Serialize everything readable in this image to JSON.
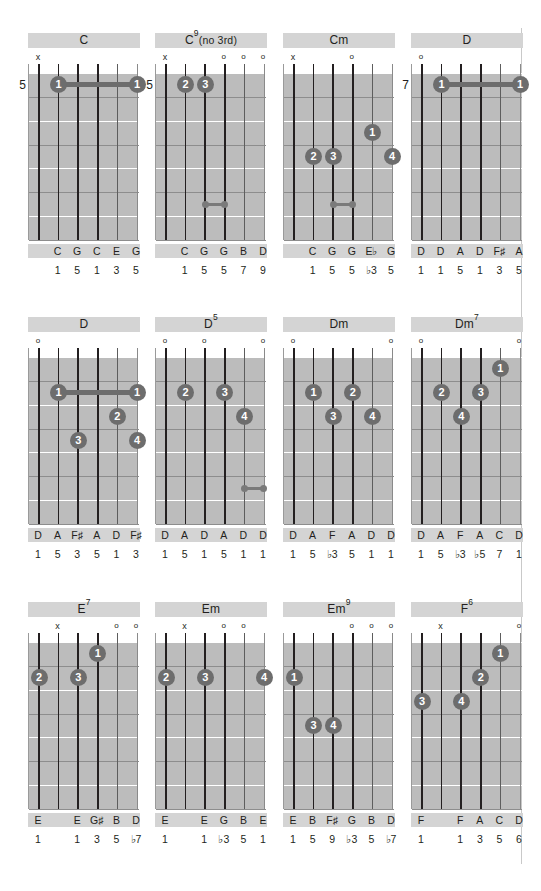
{
  "page": {
    "width": 541,
    "height": 891,
    "background": "#ffffff",
    "divider_color": "#c9c9c9",
    "board_color": "#bcbcbc",
    "label_bar_color": "#d4d4d4",
    "dot_color": "#6d6d6d",
    "string_color": "#231f20",
    "text_color": "#231f20"
  },
  "legend": {
    "muted_symbol": "x",
    "open_symbol": "o",
    "strings": 6,
    "frets": 7
  },
  "chords": [
    {
      "name": "C",
      "title_main": "C",
      "title_sup": "",
      "title_tail": "",
      "position_fret": "5",
      "markers": [
        "x",
        "",
        "",
        "",
        "",
        ""
      ],
      "dots": [
        {
          "string": 2,
          "fret": 1,
          "finger": "1"
        },
        {
          "string": 6,
          "fret": 1,
          "finger": "1"
        }
      ],
      "barres": [
        {
          "fret": 1,
          "from_string": 2,
          "to_string": 6
        }
      ],
      "links": [],
      "notes": [
        "",
        "C",
        "G",
        "C",
        "E",
        "G"
      ],
      "degrees": [
        "",
        "1",
        "5",
        "1",
        "3",
        "5"
      ]
    },
    {
      "name": "C9(no 3rd)",
      "title_main": "C",
      "title_sup": "9",
      "title_tail": "(no 3rd)",
      "position_fret": "5",
      "markers": [
        "x",
        "",
        "",
        "o",
        "o",
        "o"
      ],
      "dots": [
        {
          "string": 2,
          "fret": 1,
          "finger": "2"
        },
        {
          "string": 3,
          "fret": 1,
          "finger": "3"
        }
      ],
      "barres": [],
      "links": [
        {
          "fret": 6,
          "from_string": 3,
          "to_string": 4
        }
      ],
      "notes": [
        "",
        "C",
        "G",
        "G",
        "B",
        "D"
      ],
      "degrees": [
        "",
        "1",
        "5",
        "5",
        "7",
        "9"
      ]
    },
    {
      "name": "Cm",
      "title_main": "Cm",
      "title_sup": "",
      "title_tail": "",
      "position_fret": "",
      "markers": [
        "x",
        "",
        "",
        "o",
        "",
        ""
      ],
      "dots": [
        {
          "string": 2,
          "fret": 4,
          "finger": "2"
        },
        {
          "string": 3,
          "fret": 4,
          "finger": "3"
        },
        {
          "string": 5,
          "fret": 3,
          "finger": "1"
        },
        {
          "string": 6,
          "fret": 4,
          "finger": "4"
        }
      ],
      "barres": [],
      "links": [
        {
          "fret": 6,
          "from_string": 3,
          "to_string": 4
        }
      ],
      "notes": [
        "",
        "C",
        "G",
        "G",
        "E♭",
        "G"
      ],
      "degrees": [
        "",
        "1",
        "5",
        "5",
        "♭3",
        "5"
      ]
    },
    {
      "name": "D",
      "title_main": "D",
      "title_sup": "",
      "title_tail": "",
      "position_fret": "7",
      "markers": [
        "o",
        "",
        "",
        "",
        "",
        ""
      ],
      "dots": [
        {
          "string": 2,
          "fret": 1,
          "finger": "1"
        },
        {
          "string": 6,
          "fret": 1,
          "finger": "1"
        }
      ],
      "barres": [
        {
          "fret": 1,
          "from_string": 2,
          "to_string": 6
        }
      ],
      "links": [],
      "notes": [
        "D",
        "D",
        "A",
        "D",
        "F♯",
        "A"
      ],
      "degrees": [
        "1",
        "1",
        "5",
        "1",
        "3",
        "5"
      ]
    },
    {
      "name": "D",
      "title_main": "D",
      "title_sup": "",
      "title_tail": "",
      "position_fret": "",
      "markers": [
        "o",
        "",
        "",
        "",
        "",
        ""
      ],
      "dots": [
        {
          "string": 2,
          "fret": 2,
          "finger": "1"
        },
        {
          "string": 6,
          "fret": 2,
          "finger": "1"
        },
        {
          "string": 5,
          "fret": 3,
          "finger": "2"
        },
        {
          "string": 3,
          "fret": 4,
          "finger": "3"
        },
        {
          "string": 6,
          "fret": 4,
          "finger": "4"
        }
      ],
      "barres": [
        {
          "fret": 2,
          "from_string": 2,
          "to_string": 6
        }
      ],
      "links": [],
      "notes": [
        "D",
        "A",
        "F♯",
        "A",
        "D",
        "F♯"
      ],
      "degrees": [
        "1",
        "5",
        "3",
        "5",
        "1",
        "3"
      ]
    },
    {
      "name": "D5",
      "title_main": "D",
      "title_sup": "5",
      "title_tail": "",
      "position_fret": "",
      "markers": [
        "o",
        "",
        "o",
        "",
        "",
        "o"
      ],
      "dots": [
        {
          "string": 2,
          "fret": 2,
          "finger": "2"
        },
        {
          "string": 4,
          "fret": 2,
          "finger": "3"
        },
        {
          "string": 5,
          "fret": 3,
          "finger": "4"
        }
      ],
      "barres": [],
      "links": [
        {
          "fret": 6,
          "from_string": 5,
          "to_string": 6
        }
      ],
      "notes": [
        "D",
        "A",
        "D",
        "A",
        "D",
        "D"
      ],
      "degrees": [
        "1",
        "5",
        "1",
        "5",
        "1",
        "1"
      ]
    },
    {
      "name": "Dm",
      "title_main": "Dm",
      "title_sup": "",
      "title_tail": "",
      "position_fret": "",
      "markers": [
        "o",
        "",
        "",
        "",
        "",
        "o"
      ],
      "dots": [
        {
          "string": 2,
          "fret": 2,
          "finger": "1"
        },
        {
          "string": 4,
          "fret": 2,
          "finger": "2"
        },
        {
          "string": 3,
          "fret": 3,
          "finger": "3"
        },
        {
          "string": 5,
          "fret": 3,
          "finger": "4"
        }
      ],
      "barres": [],
      "links": [],
      "notes": [
        "D",
        "A",
        "F",
        "A",
        "D",
        "D"
      ],
      "degrees": [
        "1",
        "5",
        "♭3",
        "5",
        "1",
        "1"
      ]
    },
    {
      "name": "Dm7",
      "title_main": "Dm",
      "title_sup": "7",
      "title_tail": "",
      "position_fret": "",
      "markers": [
        "o",
        "",
        "",
        "",
        "",
        "o"
      ],
      "dots": [
        {
          "string": 5,
          "fret": 1,
          "finger": "1"
        },
        {
          "string": 2,
          "fret": 2,
          "finger": "2"
        },
        {
          "string": 4,
          "fret": 2,
          "finger": "3"
        },
        {
          "string": 3,
          "fret": 3,
          "finger": "4"
        }
      ],
      "barres": [],
      "links": [],
      "notes": [
        "D",
        "A",
        "F",
        "A",
        "C",
        "D"
      ],
      "degrees": [
        "1",
        "5",
        "♭3",
        "♭5",
        "7",
        "1"
      ]
    },
    {
      "name": "E7",
      "title_main": "E",
      "title_sup": "7",
      "title_tail": "",
      "position_fret": "",
      "markers": [
        "",
        "x",
        "",
        "",
        "o",
        "o"
      ],
      "dots": [
        {
          "string": 4,
          "fret": 1,
          "finger": "1"
        },
        {
          "string": 1,
          "fret": 2,
          "finger": "2"
        },
        {
          "string": 3,
          "fret": 2,
          "finger": "3"
        }
      ],
      "barres": [],
      "links": [],
      "notes": [
        "E",
        "",
        "E",
        "G♯",
        "B",
        "D"
      ],
      "degrees": [
        "1",
        "",
        "1",
        "3",
        "5",
        "♭7"
      ]
    },
    {
      "name": "Em",
      "title_main": "Em",
      "title_sup": "",
      "title_tail": "",
      "position_fret": "",
      "markers": [
        "",
        "x",
        "",
        "o",
        "o",
        ""
      ],
      "dots": [
        {
          "string": 1,
          "fret": 2,
          "finger": "2"
        },
        {
          "string": 3,
          "fret": 2,
          "finger": "3"
        },
        {
          "string": 6,
          "fret": 2,
          "finger": "4"
        }
      ],
      "barres": [],
      "links": [],
      "notes": [
        "E",
        "",
        "E",
        "G",
        "B",
        "E"
      ],
      "degrees": [
        "1",
        "",
        "1",
        "♭3",
        "5",
        "1"
      ]
    },
    {
      "name": "Em9",
      "title_main": "Em",
      "title_sup": "9",
      "title_tail": "",
      "position_fret": "",
      "markers": [
        "",
        "",
        "",
        "o",
        "o",
        "o"
      ],
      "dots": [
        {
          "string": 1,
          "fret": 2,
          "finger": "1"
        },
        {
          "string": 2,
          "fret": 4,
          "finger": "3"
        },
        {
          "string": 3,
          "fret": 4,
          "finger": "4"
        }
      ],
      "barres": [],
      "links": [],
      "notes": [
        "E",
        "B",
        "F♯",
        "G",
        "B",
        "D"
      ],
      "degrees": [
        "1",
        "5",
        "9",
        "♭3",
        "5",
        "♭7"
      ]
    },
    {
      "name": "F6",
      "title_main": "F",
      "title_sup": "6",
      "title_tail": "",
      "position_fret": "",
      "markers": [
        "",
        "x",
        "",
        "",
        "",
        "o"
      ],
      "dots": [
        {
          "string": 5,
          "fret": 1,
          "finger": "1"
        },
        {
          "string": 4,
          "fret": 2,
          "finger": "2"
        },
        {
          "string": 1,
          "fret": 3,
          "finger": "3"
        },
        {
          "string": 3,
          "fret": 3,
          "finger": "4"
        }
      ],
      "barres": [],
      "links": [],
      "notes": [
        "F",
        "",
        "F",
        "A",
        "C",
        "D"
      ],
      "degrees": [
        "1",
        "",
        "1",
        "3",
        "5",
        "6"
      ]
    }
  ]
}
